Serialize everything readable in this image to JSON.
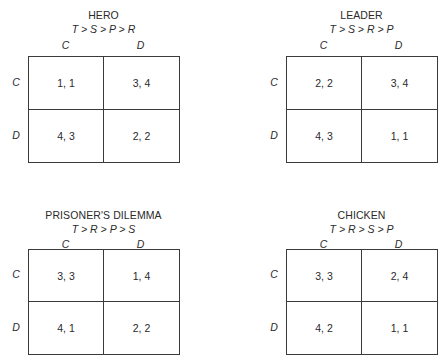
{
  "games": [
    {
      "title": "HERO",
      "ranking": "T > S > P > R",
      "column_labels": [
        "C",
        "D"
      ],
      "row_labels": [
        "C",
        "D"
      ],
      "payoffs": [
        [
          "1, 1",
          "3, 4"
        ],
        [
          "4, 3",
          "2, 2"
        ]
      ]
    },
    {
      "title": "LEADER",
      "ranking": "T > S > R > P",
      "column_labels": [
        "C",
        "D"
      ],
      "row_labels": [
        "C",
        "D"
      ],
      "payoffs": [
        [
          "2, 2",
          "3, 4"
        ],
        [
          "4, 3",
          "1, 1"
        ]
      ]
    },
    {
      "title": "PRISONER'S DILEMMA",
      "ranking": "T > R > P > S",
      "column_labels": [
        "C",
        "D"
      ],
      "row_labels": [
        "C",
        "D"
      ],
      "payoffs": [
        [
          "3, 3",
          "1, 4"
        ],
        [
          "4, 1",
          "2, 2"
        ]
      ]
    },
    {
      "title": "CHICKEN",
      "ranking": "T > R > S > P",
      "column_labels": [
        "C",
        "D"
      ],
      "row_labels": [
        "C",
        "D"
      ],
      "payoffs": [
        [
          "3, 3",
          "2, 4"
        ],
        [
          "4, 2",
          "1, 1"
        ]
      ]
    }
  ],
  "colors": {
    "line": "#3a3a3a",
    "text": "#2a2a2a",
    "background": "#ffffff"
  }
}
